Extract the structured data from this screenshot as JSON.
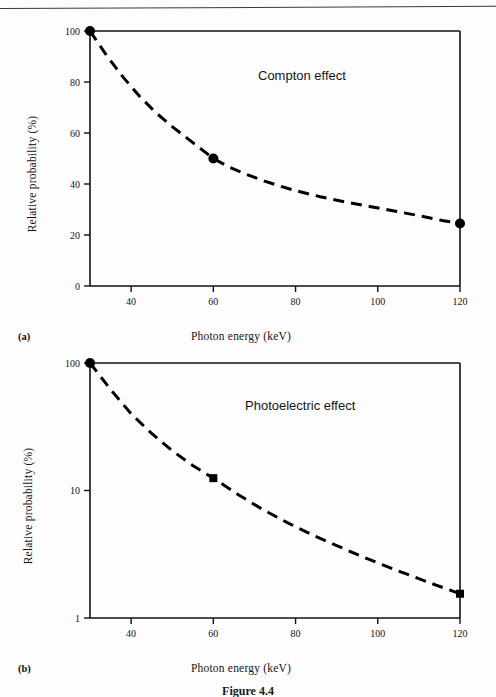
{
  "page": {
    "rule_visible": true,
    "caption": "Figure 4.4"
  },
  "figures": [
    {
      "panel_label": "(a)",
      "annotation": "Compton effect",
      "xlabel": "Photon energy (keV)",
      "ylabel": "Relative probability (%)"
    },
    {
      "panel_label": "(b)",
      "annotation": "Photoelectric effect",
      "xlabel": "Photon energy (keV)",
      "ylabel": "Relative probability (%)"
    }
  ],
  "chart_data": [
    {
      "type": "line",
      "title": "Compton effect",
      "xlabel": "Photon energy (keV)",
      "ylabel": "Relative probability (%)",
      "xscale": "linear",
      "yscale": "linear",
      "xlim": [
        30,
        120
      ],
      "ylim": [
        0,
        100
      ],
      "xticks": [
        40,
        60,
        80,
        100,
        120
      ],
      "xticklabels": [
        "40",
        "60",
        "80",
        "100",
        "120"
      ],
      "yticks": [
        0,
        20,
        40,
        60,
        80,
        100
      ],
      "yticklabels": [
        "0",
        "20",
        "40",
        "60",
        "80",
        "100"
      ],
      "grid": false,
      "legend": "none",
      "linestyle": "dashed",
      "linecolor": "#000000",
      "markers": [
        {
          "x": 30,
          "y": 100,
          "shape": "circle"
        },
        {
          "x": 60,
          "y": 50,
          "shape": "circle"
        },
        {
          "x": 120,
          "y": 24.5,
          "shape": "circle"
        }
      ],
      "x": [
        30,
        34,
        38,
        42,
        46,
        50,
        54,
        58,
        60,
        64,
        68,
        72,
        76,
        80,
        86,
        92,
        98,
        104,
        110,
        116,
        120
      ],
      "values": [
        100,
        90.5,
        82,
        74.5,
        68,
        62.5,
        57.5,
        52.5,
        50,
        46.5,
        43.8,
        41.4,
        39.3,
        37.4,
        35,
        33,
        31.2,
        29.4,
        27.6,
        25.6,
        24.5
      ]
    },
    {
      "type": "line",
      "title": "Photoelectric effect",
      "xlabel": "Photon energy (keV)",
      "ylabel": "Relative probability (%)",
      "xscale": "linear",
      "yscale": "log",
      "xlim": [
        30,
        120
      ],
      "ylim": [
        1,
        100
      ],
      "xticks": [
        40,
        60,
        80,
        100,
        120
      ],
      "xticklabels": [
        "40",
        "60",
        "80",
        "100",
        "120"
      ],
      "yticks": [
        1,
        10,
        100
      ],
      "yticklabels": [
        "1",
        "10",
        "100"
      ],
      "grid": false,
      "legend": "none",
      "linestyle": "dashed",
      "linecolor": "#000000",
      "markers": [
        {
          "x": 30,
          "y": 100,
          "shape": "circle"
        },
        {
          "x": 60,
          "y": 12.5,
          "shape": "square"
        },
        {
          "x": 120,
          "y": 1.55,
          "shape": "square"
        }
      ],
      "x": [
        30,
        35,
        40,
        45,
        50,
        55,
        60,
        66,
        72,
        78,
        84,
        90,
        96,
        102,
        108,
        114,
        120
      ],
      "values": [
        100,
        62,
        40,
        28,
        20.5,
        15.7,
        12.5,
        9.3,
        7.1,
        5.6,
        4.5,
        3.7,
        3.05,
        2.55,
        2.15,
        1.82,
        1.55
      ]
    }
  ]
}
